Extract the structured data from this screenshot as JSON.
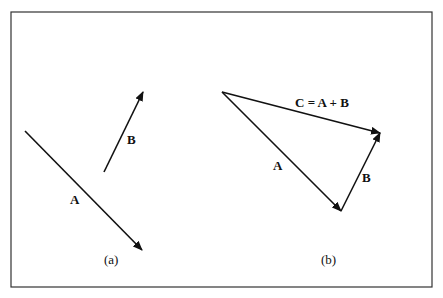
{
  "figure": {
    "panel_a": {
      "caption": "(a)",
      "vector_a_label": "A",
      "vector_b_label": "B"
    },
    "panel_b": {
      "caption": "(b)",
      "vector_a_label": "A",
      "vector_b_label": "B",
      "resultant_label": "C = A + B"
    },
    "colors": {
      "line": "#111111",
      "border": "#333333",
      "background": "#ffffff"
    }
  }
}
